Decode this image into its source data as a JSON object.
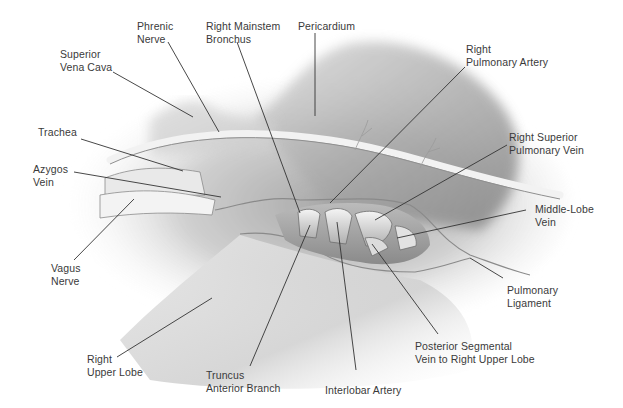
{
  "figure": {
    "colors": {
      "tissue_light": "#e8e8e8",
      "tissue_mid": "#bdbdbd",
      "tissue_dark": "#7a7a7a",
      "leader": "#333333",
      "text": "#3a3a3a"
    }
  },
  "labels": [
    {
      "id": "phrenic-nerve",
      "lines": [
        "Phrenic",
        "Nerve"
      ],
      "x": 137,
      "y": 20,
      "align": "left",
      "leader": [
        [
          168,
          42
        ],
        [
          219,
          132
        ]
      ]
    },
    {
      "id": "right-mainstem-bronchus",
      "lines": [
        "Right Mainstem",
        "Bronchus"
      ],
      "x": 206,
      "y": 20,
      "align": "left",
      "leader": [
        [
          237,
          42
        ],
        [
          300,
          213
        ]
      ]
    },
    {
      "id": "pericardium",
      "lines": [
        "Pericardium"
      ],
      "x": 298,
      "y": 20,
      "align": "left",
      "leader": [
        [
          315,
          33
        ],
        [
          315,
          116
        ]
      ]
    },
    {
      "id": "superior-vena-cava",
      "lines": [
        "Superior",
        "Vena Cava"
      ],
      "x": 60,
      "y": 48,
      "align": "left",
      "leader": [
        [
          113,
          72
        ],
        [
          193,
          117
        ]
      ]
    },
    {
      "id": "right-pulmonary-artery",
      "lines": [
        "Right",
        "Pulmonary Artery"
      ],
      "x": 466,
      "y": 43,
      "align": "left",
      "leader": [
        [
          465,
          67
        ],
        [
          330,
          203
        ]
      ]
    },
    {
      "id": "trachea",
      "lines": [
        "Trachea"
      ],
      "x": 38,
      "y": 126,
      "align": "left",
      "leader": [
        [
          81,
          139
        ],
        [
          183,
          171
        ]
      ]
    },
    {
      "id": "right-superior-pulmonary-vein",
      "lines": [
        "Right Superior",
        "Pulmonary Vein"
      ],
      "x": 509,
      "y": 131,
      "align": "left",
      "leader": [
        [
          507,
          145
        ],
        [
          375,
          220
        ]
      ]
    },
    {
      "id": "azygos-vein",
      "lines": [
        "Azygos",
        "Vein"
      ],
      "x": 33,
      "y": 163,
      "align": "left",
      "leader": [
        [
          74,
          172
        ],
        [
          221,
          197
        ]
      ]
    },
    {
      "id": "middle-lobe-vein",
      "lines": [
        "Middle-Lobe",
        "Vein"
      ],
      "x": 535,
      "y": 203,
      "align": "left",
      "leader": [
        [
          526,
          210
        ],
        [
          397,
          238
        ]
      ]
    },
    {
      "id": "vagus-nerve",
      "lines": [
        "Vagus",
        "Nerve"
      ],
      "x": 51,
      "y": 262,
      "align": "left",
      "leader": [
        [
          74,
          260
        ],
        [
          134,
          199
        ]
      ]
    },
    {
      "id": "pulmonary-ligament",
      "lines": [
        "Pulmonary",
        "Ligament"
      ],
      "x": 507,
      "y": 284,
      "align": "left",
      "leader": [
        [
          503,
          278
        ],
        [
          470,
          258
        ]
      ]
    },
    {
      "id": "right-upper-lobe",
      "lines": [
        "Right",
        "Upper Lobe"
      ],
      "x": 87,
      "y": 353,
      "align": "left",
      "leader": [
        [
          117,
          357
        ],
        [
          212,
          298
        ]
      ]
    },
    {
      "id": "posterior-segmental-vein",
      "lines": [
        "Posterior Segmental",
        "Vein to Right Upper Lobe"
      ],
      "x": 415,
      "y": 340,
      "align": "left",
      "leader": [
        [
          438,
          334
        ],
        [
          372,
          244
        ]
      ]
    },
    {
      "id": "truncus-anterior-branch",
      "lines": [
        "Truncus",
        "Anterior Branch"
      ],
      "x": 206,
      "y": 369,
      "align": "left",
      "leader": [
        [
          250,
          366
        ],
        [
          310,
          225
        ]
      ]
    },
    {
      "id": "interlobar-artery",
      "lines": [
        "Interlobar Artery"
      ],
      "x": 325,
      "y": 384,
      "align": "left",
      "leader": [
        [
          356,
          370
        ],
        [
          337,
          222
        ]
      ]
    }
  ]
}
